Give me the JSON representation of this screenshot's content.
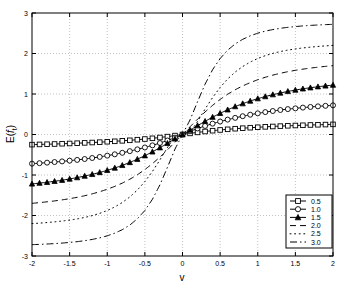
{
  "chart_data": {
    "type": "line",
    "title": "",
    "xlabel": "v",
    "ylabel": "E( f_t )",
    "ylabel_base": "E(",
    "ylabel_var": "f",
    "ylabel_sub": "t",
    "ylabel_close": ")",
    "xlim": [
      -2,
      2
    ],
    "ylim": [
      -3,
      3
    ],
    "grid": true,
    "grid_style": "dotted",
    "legend_position": "lower-right",
    "legend_title": "",
    "xticks": [
      -2,
      -1.5,
      -1,
      -0.5,
      0,
      0.5,
      1,
      1.5,
      2
    ],
    "xtick_labels": [
      "-2",
      "-1.5",
      "-1",
      "-0.5",
      "0",
      "0.5",
      "1",
      "1.5",
      "2"
    ],
    "yticks": [
      -3,
      -2,
      -1,
      0,
      1,
      2,
      3
    ],
    "ytick_labels": [
      "-3",
      "-2",
      "-1",
      "0",
      "1",
      "2",
      "3"
    ],
    "x": [
      -2,
      -1.9,
      -1.8,
      -1.7,
      -1.6,
      -1.5,
      -1.4,
      -1.3,
      -1.2,
      -1.1,
      -1,
      -0.9,
      -0.8,
      -0.7,
      -0.6,
      -0.5,
      -0.4,
      -0.3,
      -0.2,
      -0.1,
      0,
      0.1,
      0.2,
      0.3,
      0.4,
      0.5,
      0.6,
      0.7,
      0.8,
      0.9,
      1,
      1.1,
      1.2,
      1.3,
      1.4,
      1.5,
      1.6,
      1.7,
      1.8,
      1.9,
      2
    ],
    "series": [
      {
        "name": "0.5",
        "label": "0.5",
        "marker": "square",
        "linestyle": "solid",
        "values": [
          -0.25,
          -0.245,
          -0.24,
          -0.235,
          -0.228,
          -0.222,
          -0.215,
          -0.207,
          -0.198,
          -0.189,
          -0.179,
          -0.168,
          -0.156,
          -0.143,
          -0.128,
          -0.112,
          -0.094,
          -0.074,
          -0.052,
          -0.027,
          0,
          0.027,
          0.052,
          0.074,
          0.094,
          0.112,
          0.128,
          0.143,
          0.156,
          0.168,
          0.179,
          0.189,
          0.198,
          0.207,
          0.215,
          0.222,
          0.228,
          0.235,
          0.24,
          0.245,
          0.25
        ]
      },
      {
        "name": "1.0",
        "label": "1.0",
        "marker": "circle",
        "linestyle": "solid",
        "values": [
          -0.72,
          -0.708,
          -0.695,
          -0.68,
          -0.664,
          -0.646,
          -0.627,
          -0.605,
          -0.58,
          -0.553,
          -0.522,
          -0.489,
          -0.452,
          -0.411,
          -0.367,
          -0.32,
          -0.268,
          -0.211,
          -0.148,
          -0.078,
          0,
          0.078,
          0.148,
          0.211,
          0.268,
          0.32,
          0.367,
          0.411,
          0.452,
          0.489,
          0.522,
          0.553,
          0.58,
          0.605,
          0.627,
          0.646,
          0.664,
          0.68,
          0.695,
          0.708,
          0.72
        ]
      },
      {
        "name": "1.5",
        "label": "1.5",
        "marker": "triangle",
        "linestyle": "solid",
        "values": [
          -1.22,
          -1.2,
          -1.18,
          -1.155,
          -1.128,
          -1.098,
          -1.064,
          -1.026,
          -0.984,
          -0.937,
          -0.885,
          -0.827,
          -0.762,
          -0.69,
          -0.61,
          -0.523,
          -0.428,
          -0.326,
          -0.218,
          -0.108,
          0,
          0.108,
          0.218,
          0.326,
          0.428,
          0.523,
          0.61,
          0.69,
          0.762,
          0.827,
          0.885,
          0.937,
          0.984,
          1.026,
          1.064,
          1.098,
          1.128,
          1.155,
          1.18,
          1.2,
          1.22
        ]
      },
      {
        "name": "2.0",
        "label": "2.0",
        "marker": "none",
        "linestyle": "dashed",
        "values": [
          -1.7,
          -1.682,
          -1.662,
          -1.64,
          -1.614,
          -1.585,
          -1.551,
          -1.512,
          -1.466,
          -1.413,
          -1.352,
          -1.281,
          -1.2,
          -1.105,
          -0.994,
          -0.866,
          -0.72,
          -0.557,
          -0.379,
          -0.191,
          0,
          0.191,
          0.379,
          0.557,
          0.72,
          0.866,
          0.994,
          1.105,
          1.2,
          1.281,
          1.352,
          1.413,
          1.466,
          1.512,
          1.551,
          1.585,
          1.614,
          1.64,
          1.662,
          1.682,
          1.7
        ]
      },
      {
        "name": "2.5",
        "label": "2.5",
        "marker": "none",
        "linestyle": "dotted",
        "values": [
          -2.2,
          -2.188,
          -2.174,
          -2.157,
          -2.137,
          -2.113,
          -2.084,
          -2.048,
          -2.003,
          -1.947,
          -1.877,
          -1.789,
          -1.679,
          -1.542,
          -1.371,
          -1.162,
          -0.913,
          -0.628,
          -0.322,
          -0.041,
          0,
          0.041,
          0.322,
          0.628,
          0.913,
          1.162,
          1.371,
          1.542,
          1.679,
          1.789,
          1.877,
          1.947,
          2.003,
          2.048,
          2.084,
          2.113,
          2.137,
          2.157,
          2.174,
          2.188,
          2.2
        ]
      },
      {
        "name": "3.0",
        "label": "3.0",
        "marker": "none",
        "linestyle": "dashdot",
        "values": [
          -2.72,
          -2.713,
          -2.704,
          -2.694,
          -2.681,
          -2.665,
          -2.646,
          -2.622,
          -2.591,
          -2.552,
          -2.502,
          -2.436,
          -2.35,
          -2.236,
          -2.082,
          -1.876,
          -1.6,
          -1.243,
          -0.81,
          -0.36,
          0,
          0.36,
          0.81,
          1.243,
          1.6,
          1.876,
          2.082,
          2.236,
          2.35,
          2.436,
          2.502,
          2.552,
          2.591,
          2.622,
          2.646,
          2.665,
          2.681,
          2.694,
          2.704,
          2.713,
          2.72
        ]
      }
    ]
  }
}
